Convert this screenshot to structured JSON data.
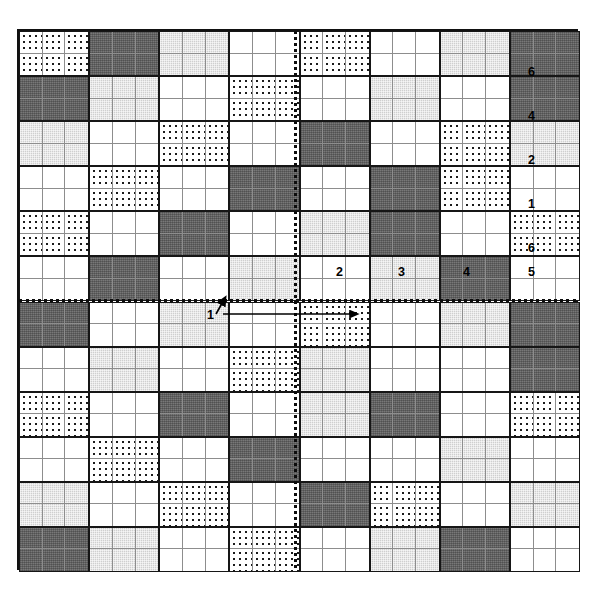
{
  "figure": {
    "grid": {
      "block_columns": 8,
      "block_rows": 12,
      "cells_per_block_x": 3,
      "cells_per_block_y": 2,
      "total_columns": 24,
      "total_rows": 24
    },
    "fill_legend": [
      {
        "key": "white",
        "name": "blank",
        "color": "#ffffff"
      },
      {
        "key": "light",
        "name": "light-stipple",
        "color": "#cfcfcf"
      },
      {
        "key": "dark",
        "name": "dark-stipple",
        "color": "#787878"
      },
      {
        "key": "dot",
        "name": "dotted",
        "color": "#ffffff"
      }
    ],
    "blocks": [
      [
        "dot",
        "dark",
        "light",
        "white",
        "dot",
        "white",
        "light",
        "dark"
      ],
      [
        "dark",
        "light",
        "white",
        "dot",
        "white",
        "light",
        "white",
        "dark"
      ],
      [
        "light",
        "white",
        "dot",
        "white",
        "dark",
        "white",
        "dot",
        "light"
      ],
      [
        "white",
        "dot",
        "white",
        "dark",
        "white",
        "dark",
        "dot",
        "white"
      ],
      [
        "dot",
        "white",
        "dark",
        "white",
        "light",
        "dark",
        "white",
        "dot"
      ],
      [
        "white",
        "dark",
        "white",
        "light",
        "white",
        "light",
        "dark",
        "white"
      ],
      [
        "dark",
        "white",
        "light",
        "white",
        "dot",
        "white",
        "light",
        "dark"
      ],
      [
        "white",
        "light",
        "white",
        "dot",
        "light",
        "white",
        "white",
        "dark"
      ],
      [
        "dot",
        "white",
        "dark",
        "white",
        "light",
        "dark",
        "white",
        "dot"
      ],
      [
        "white",
        "dot",
        "white",
        "dark",
        "white",
        "white",
        "light",
        "white"
      ],
      [
        "light",
        "white",
        "dot",
        "white",
        "dark",
        "dot",
        "white",
        "light"
      ],
      [
        "dark",
        "light",
        "white",
        "dot",
        "white",
        "light",
        "dark",
        "white"
      ],
      [
        "dot",
        "dark",
        "light",
        "white",
        "dot",
        "white",
        "light",
        "dark"
      ],
      [
        "white",
        "light",
        "white",
        "dark",
        "white",
        "dot",
        "white",
        "white"
      ],
      [
        "light",
        "white",
        "dark",
        "white",
        "dot",
        "white",
        "light",
        "dark"
      ],
      [
        "dark",
        "white",
        "light",
        "white",
        "white",
        "dark",
        "white",
        "dot"
      ],
      [
        "white",
        "dot",
        "white",
        "light",
        "dark",
        "white",
        "dot",
        "white"
      ],
      [
        "dot",
        "white",
        "dark",
        "white",
        "light",
        "white",
        "white",
        "light"
      ],
      [
        "white",
        "light",
        "white",
        "dot",
        "white",
        "dot",
        "light",
        "white"
      ],
      [
        "light",
        "white",
        "dot",
        "white",
        "dark",
        "white",
        "white",
        "light"
      ],
      [
        "white",
        "dot",
        "light",
        "white",
        "dark",
        "dot",
        "white",
        "white"
      ],
      [
        "dark",
        "light",
        "white",
        "dot",
        "white",
        "light",
        "white",
        "dark"
      ],
      [
        "dot",
        "dark",
        "light",
        "white",
        "dot",
        "white",
        "light",
        "white"
      ],
      [
        "white",
        "light",
        "white",
        "dark",
        "white",
        "light",
        "dark",
        "dot"
      ]
    ],
    "axes": {
      "vertical": {
        "name": "mirror-axis-vertical",
        "x_px": 294
      },
      "horizontal": {
        "name": "mirror-axis-horizontal",
        "y_px": 299
      }
    },
    "labels": [
      {
        "text": "6",
        "x": 528,
        "y": 66
      },
      {
        "text": "4",
        "x": 528,
        "y": 110
      },
      {
        "text": "2",
        "x": 528,
        "y": 154
      },
      {
        "text": "1",
        "x": 528,
        "y": 198
      },
      {
        "text": "6",
        "x": 528,
        "y": 242
      },
      {
        "text": "5",
        "x": 528,
        "y": 266
      },
      {
        "text": "4",
        "x": 463,
        "y": 266
      },
      {
        "text": "3",
        "x": 398,
        "y": 266
      },
      {
        "text": "2",
        "x": 336,
        "y": 266
      },
      {
        "text": "1",
        "x": 207,
        "y": 309
      }
    ],
    "pointer_arrows": [
      {
        "name": "label-1-callout-arrow",
        "from": [
          214,
          318
        ],
        "to": [
          224,
          300
        ]
      },
      {
        "name": "translation-vector-arrow",
        "from": [
          224,
          313
        ],
        "to": [
          362,
          313
        ]
      }
    ]
  }
}
